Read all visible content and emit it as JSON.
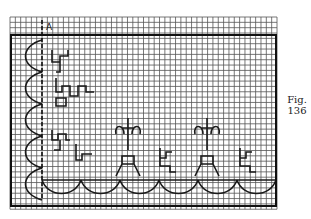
{
  "figure": {
    "label_line1": "Fig.",
    "label_line2": "136",
    "marker_label": "A"
  },
  "grid": {
    "x0": 10,
    "y0": 17,
    "cols": 50,
    "rows": 36,
    "cell": 5.34,
    "frame": {
      "x": 11,
      "y": 35,
      "w": 265,
      "h": 171
    },
    "line_color": "#2a2a2a",
    "fill_color": "#2a2a2a"
  },
  "motifs": {
    "description": "Filet crochet / cross-stitch border pattern with scalloped edge on left and bottom, cross/fleur motifs along the bottom and scroll motifs on left side"
  }
}
